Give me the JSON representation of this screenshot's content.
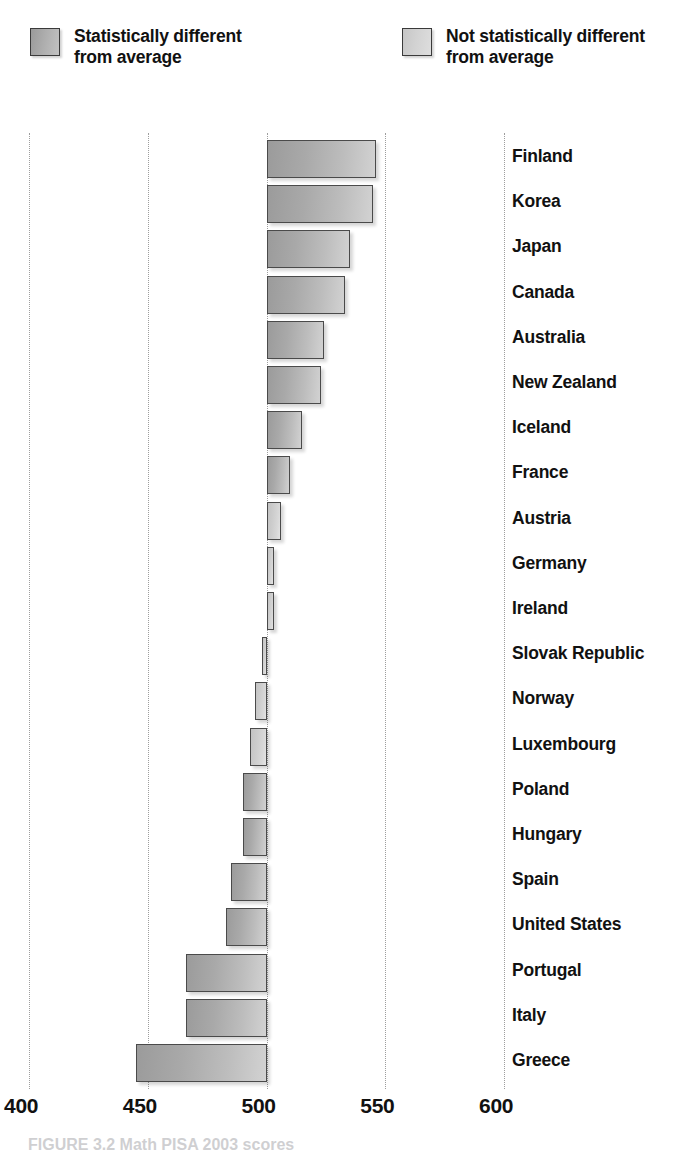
{
  "legend": {
    "entries": [
      {
        "label": "Statistically different\nfrom average",
        "style": "dark",
        "color": "#a9a9a9"
      },
      {
        "label": "Not statistically different\nfrom average",
        "style": "light",
        "color": "#d2d2d2"
      }
    ]
  },
  "axis": {
    "ticks": [
      400,
      450,
      500,
      550,
      600
    ],
    "tick_labels": [
      "400",
      "450",
      "500",
      "550",
      "600"
    ],
    "min": 400,
    "max": 600,
    "baseline": 500
  },
  "caption": "FIGURE 3.2  Math PISA 2003 scores",
  "chart_data": {
    "type": "bar",
    "orientation": "horizontal",
    "title": "",
    "subtitle": "",
    "xlabel": "",
    "ylabel": "",
    "xlim": [
      400,
      600
    ],
    "grid": true,
    "gridlines_at": [
      400,
      450,
      500,
      550,
      600
    ],
    "baseline": 500,
    "legend_position": "top",
    "categories": [
      "Finland",
      "Korea",
      "Japan",
      "Canada",
      "Australia",
      "New Zealand",
      "Iceland",
      "France",
      "Austria",
      "Germany",
      "Ireland",
      "Slovak Republic",
      "Norway",
      "Luxembourg",
      "Poland",
      "Hungary",
      "Spain",
      "United States",
      "Portugal",
      "Italy",
      "Greece"
    ],
    "values": [
      546,
      545,
      535,
      533,
      524,
      523,
      515,
      510,
      506,
      503,
      503,
      498,
      495,
      493,
      490,
      490,
      485,
      483,
      466,
      466,
      445
    ],
    "significance": [
      "different",
      "different",
      "different",
      "different",
      "different",
      "different",
      "different",
      "different",
      "not-different",
      "not-different",
      "not-different",
      "not-different",
      "not-different",
      "not-different",
      "different",
      "different",
      "different",
      "different",
      "different",
      "different",
      "different"
    ],
    "series": [
      {
        "name": "Mean score",
        "values": [
          546,
          545,
          535,
          533,
          524,
          523,
          515,
          510,
          506,
          503,
          503,
          498,
          495,
          493,
          490,
          490,
          485,
          483,
          466,
          466,
          445
        ]
      }
    ]
  }
}
